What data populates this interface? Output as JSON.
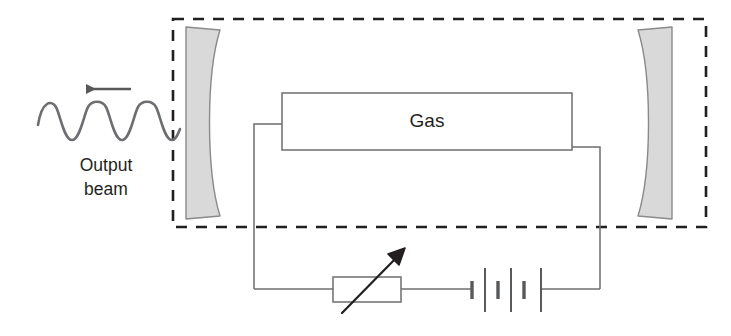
{
  "figure": {
    "width": 731,
    "height": 336,
    "background_color": "#ffffff"
  },
  "labels": {
    "gas_tube": "Gas",
    "output_beam_line1": "Output",
    "output_beam_line2": "beam"
  },
  "colors": {
    "stroke": "#6d6e71",
    "text": "#231f20",
    "mirror_fill": "#d9d9d9",
    "mirror_stroke": "#8a8a8a",
    "dashed_stroke": "#231f20",
    "arrow_fill": "#58595b",
    "background": "#ffffff"
  },
  "components": {
    "cavity_enclosure": {
      "name": "optical cavity boundary",
      "style": "dashed rectangle",
      "x": 173,
      "y": 19,
      "width": 533,
      "height": 208
    },
    "left_mirror": {
      "name": "concave output coupler mirror",
      "x": 186,
      "y": 27,
      "width": 34,
      "height": 192
    },
    "right_mirror": {
      "name": "concave rear mirror",
      "x": 638,
      "y": 27,
      "width": 34,
      "height": 192
    },
    "gas_tube": {
      "name": "gas discharge tube",
      "x": 282,
      "y": 93,
      "width": 290,
      "height": 57
    },
    "variable_resistor": {
      "name": "variable resistor / rheostat",
      "x": 333,
      "y": 277,
      "width": 68,
      "height": 25,
      "has_diagonal_arrow": true
    },
    "battery": {
      "name": "battery / DC supply",
      "cells": 3,
      "x": 470,
      "y": 289
    },
    "output_beam": {
      "name": "output laser beam",
      "wave_cycles": 3,
      "direction": "left",
      "arrow_from_x": 130,
      "arrow_to_x": 78,
      "arrow_y": 89
    }
  }
}
